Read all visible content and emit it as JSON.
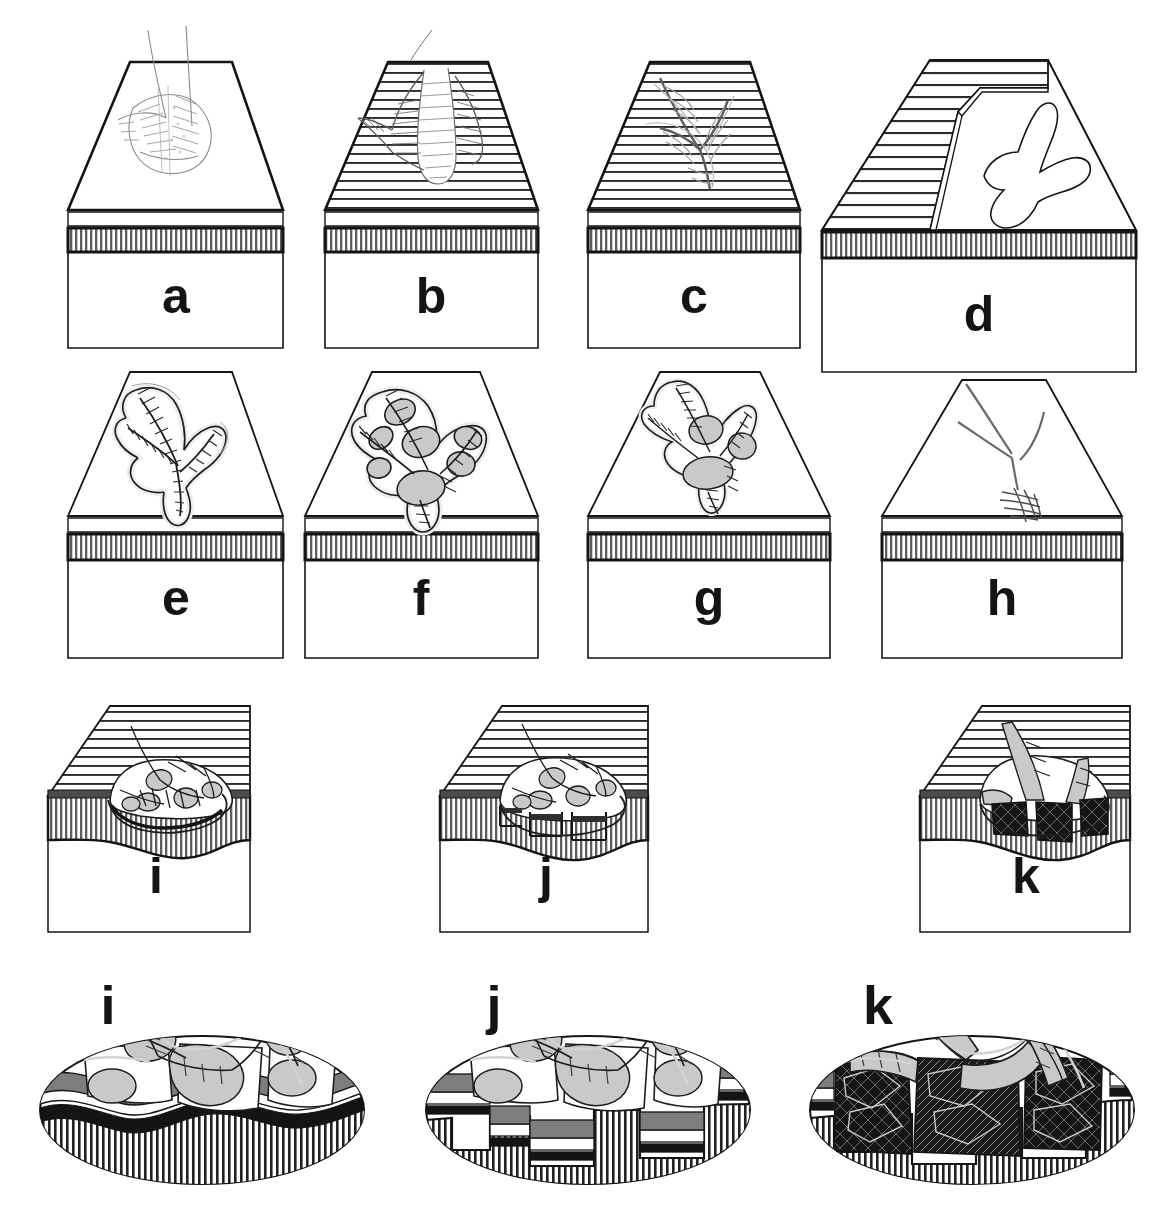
{
  "figure": {
    "width": 1176,
    "height": 1229,
    "background_color": "#ffffff",
    "rows": 4,
    "panel_count": 14
  },
  "colors": {
    "outline": "#141414",
    "hatch_line": "#3a3a3a",
    "pad_fill": "#c9c9c9",
    "band_fill": "#7a7a7a",
    "dark_fill": "#111111",
    "mid_gray": "#808080",
    "light_gray": "#e4e4e4",
    "white": "#ffffff",
    "trace_line": "#6b6b6b"
  },
  "rows": [
    {
      "name": "row-1-surface-views",
      "description": "Oblique block diagrams of the track-bearing surface",
      "panels": [
        {
          "id": "a",
          "label": "a",
          "top_face_hatch": "none",
          "trace_style": "faint-outline-foot-with-scratches",
          "has_gray_pads": false,
          "band_hatch": "vertical",
          "cut_away": false
        },
        {
          "id": "b",
          "label": "b",
          "top_face_hatch": "horizontal",
          "trace_style": "deformed-laminae-around-digit",
          "has_gray_pads": false,
          "band_hatch": "vertical",
          "cut_away": false
        },
        {
          "id": "c",
          "label": "c",
          "top_face_hatch": "horizontal",
          "trace_style": "faint-tridactyl-outline",
          "has_gray_pads": false,
          "band_hatch": "vertical",
          "cut_away": false
        },
        {
          "id": "d",
          "label": "d",
          "top_face_hatch": "horizontal-partial",
          "trace_style": "clear-tridactyl-footprint-outline",
          "has_gray_pads": false,
          "band_hatch": "vertical",
          "cut_away": true
        }
      ]
    },
    {
      "name": "row-2-track-detail-views",
      "description": "Oblique blocks showing progressive track detail and pad preservation",
      "panels": [
        {
          "id": "e",
          "label": "e",
          "top_face_hatch": "none",
          "trace_style": "hatched-tridactyl-track-no-pads",
          "has_gray_pads": false,
          "band_hatch": "vertical",
          "cut_away": false
        },
        {
          "id": "f",
          "label": "f",
          "top_face_hatch": "none",
          "trace_style": "hatched-tridactyl-track-with-pads",
          "has_gray_pads": true,
          "pad_count": 7,
          "band_hatch": "vertical",
          "cut_away": false
        },
        {
          "id": "g",
          "label": "g",
          "top_face_hatch": "none",
          "trace_style": "narrow-deep-track-with-pads",
          "has_gray_pads": true,
          "pad_count": 3,
          "band_hatch": "vertical",
          "cut_away": false
        },
        {
          "id": "h",
          "label": "h",
          "top_face_hatch": "none",
          "trace_style": "thin-scratch-trace-only",
          "has_gray_pads": false,
          "band_hatch": "vertical",
          "cut_away": false
        }
      ]
    },
    {
      "name": "row-3-section-blocks",
      "description": "Cut block diagrams showing subsurface deformation beneath the track",
      "panels": [
        {
          "id": "i",
          "label": "i",
          "top_face_hatch": "horizontal",
          "deformation": "gentle-downwarping",
          "fracture_fill": "none",
          "band_hatch": "vertical",
          "has_gray_pads": true
        },
        {
          "id": "j",
          "label": "j",
          "top_face_hatch": "horizontal",
          "deformation": "faulted-blocks-offset",
          "fracture_fill": "none",
          "band_hatch": "vertical",
          "has_gray_pads": true
        },
        {
          "id": "k",
          "label": "k",
          "top_face_hatch": "horizontal",
          "deformation": "brecciated-collapse",
          "fracture_fill": "dark-breccia",
          "band_hatch": "vertical",
          "has_gray_pads": true
        }
      ]
    },
    {
      "name": "row-4-enlarged-ellipse-details",
      "description": "Enlarged elliptical cut-outs of the subsurface deformation in i, j and k",
      "panels": [
        {
          "id": "i",
          "label": "i",
          "shape": "ellipse",
          "deformation": "continuous-folded-laminae",
          "fracture_fill": "none",
          "base_hatch": "vertical",
          "has_gray_pads": true
        },
        {
          "id": "j",
          "label": "j",
          "shape": "ellipse",
          "deformation": "discrete-faulted-blocks",
          "fracture_fill": "none",
          "base_hatch": "vertical",
          "has_gray_pads": true
        },
        {
          "id": "k",
          "label": "k",
          "shape": "ellipse",
          "deformation": "brecciated-shattered-laminae",
          "fracture_fill": "dark-breccia",
          "base_hatch": "vertical",
          "has_gray_pads": true
        }
      ]
    }
  ],
  "labels": {
    "a": "a",
    "b": "b",
    "c": "c",
    "d": "d",
    "e": "e",
    "f": "f",
    "g": "g",
    "h": "h",
    "i": "i",
    "j": "j",
    "k": "k",
    "i2": "i",
    "j2": "j",
    "k2": "k"
  }
}
